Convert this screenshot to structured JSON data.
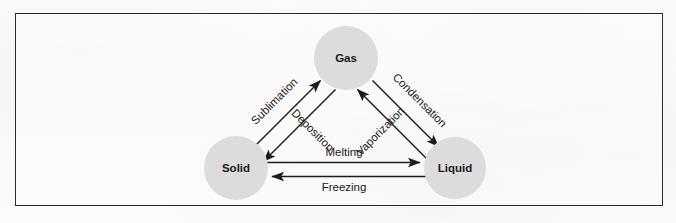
{
  "figure": {
    "type": "state-change-diagram",
    "background_color": "#fbfbfb",
    "frame_color": "#2b2b2b",
    "node_fill_color": "#dcdcdc",
    "line_color": "#1c1c1c",
    "text_color": "#1a1a1a"
  },
  "nodes": [
    {
      "id": "gas",
      "label": "Gas",
      "cx": 346,
      "cy": 58,
      "r": 32
    },
    {
      "id": "solid",
      "label": "Solid",
      "cx": 236,
      "cy": 168,
      "r": 32
    },
    {
      "id": "liquid",
      "label": "Liquid",
      "cx": 455,
      "cy": 168,
      "r": 31
    }
  ],
  "edges": [
    {
      "id": "sublimation",
      "label": "Sublimation",
      "from": "solid",
      "to": "gas",
      "direction": "up-right"
    },
    {
      "id": "deposition",
      "label": "Deposition",
      "from": "gas",
      "to": "solid",
      "direction": "down-left"
    },
    {
      "id": "condensation",
      "label": "Condensation",
      "from": "gas",
      "to": "liquid",
      "direction": "down-right"
    },
    {
      "id": "vaporization",
      "label": "Vaporization",
      "from": "liquid",
      "to": "gas",
      "direction": "up-left"
    },
    {
      "id": "melting",
      "label": "Melting",
      "from": "solid",
      "to": "liquid",
      "direction": "right"
    },
    {
      "id": "freezing",
      "label": "Freezing",
      "from": "liquid",
      "to": "solid",
      "direction": "left"
    }
  ]
}
